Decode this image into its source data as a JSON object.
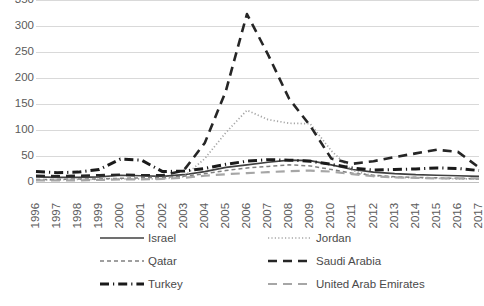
{
  "chart_data": {
    "type": "line",
    "title": "",
    "xlabel": "",
    "ylabel": "",
    "grid": true,
    "legend_position": "bottom",
    "ylim": [
      0,
      350
    ],
    "yticks": [
      0,
      50,
      100,
      150,
      200,
      250,
      300,
      350
    ],
    "categories": [
      "1996",
      "1997",
      "1998",
      "1999",
      "2000",
      "2001",
      "2002",
      "2003",
      "2004",
      "2005",
      "2006",
      "2007",
      "2008",
      "2009",
      "2010",
      "2011",
      "2012",
      "2013",
      "2014",
      "2015",
      "2016",
      "2017"
    ],
    "series": [
      {
        "name": "Israel",
        "style": "solid",
        "color": "#404040",
        "values": [
          10,
          9,
          9,
          10,
          13,
          12,
          11,
          14,
          20,
          28,
          33,
          38,
          42,
          41,
          33,
          24,
          19,
          16,
          14,
          13,
          12,
          11
        ]
      },
      {
        "name": "Jordan",
        "style": "dotted",
        "color": "#a6a6a6",
        "values": [
          4,
          4,
          5,
          5,
          6,
          6,
          6,
          10,
          45,
          95,
          138,
          120,
          113,
          112,
          60,
          22,
          12,
          9,
          8,
          7,
          6,
          6
        ]
      },
      {
        "name": "Qatar",
        "style": "dashed-small",
        "color": "#808080",
        "values": [
          5,
          5,
          6,
          6,
          7,
          8,
          9,
          11,
          16,
          22,
          27,
          30,
          33,
          31,
          24,
          17,
          13,
          10,
          9,
          8,
          7,
          6
        ]
      },
      {
        "name": "Saudi Arabia",
        "style": "dashed-long",
        "color": "#262626",
        "values": [
          12,
          11,
          12,
          13,
          14,
          13,
          13,
          22,
          75,
          175,
          323,
          245,
          160,
          108,
          45,
          35,
          40,
          48,
          55,
          62,
          58,
          28
        ]
      },
      {
        "name": "Turkey",
        "style": "dash-dot",
        "color": "#1a1a1a",
        "values": [
          20,
          18,
          19,
          24,
          44,
          42,
          20,
          21,
          26,
          34,
          40,
          43,
          42,
          40,
          34,
          27,
          23,
          24,
          25,
          27,
          26,
          22
        ]
      },
      {
        "name": "United Arab Emirates",
        "style": "dashed-gray",
        "color": "#a6a6a6",
        "values": [
          3,
          3,
          3,
          4,
          5,
          5,
          6,
          8,
          12,
          15,
          17,
          19,
          21,
          22,
          20,
          15,
          11,
          9,
          8,
          7,
          7,
          7
        ]
      }
    ]
  },
  "legend": {
    "items": [
      {
        "label": "Israel"
      },
      {
        "label": "Jordan"
      },
      {
        "label": "Qatar"
      },
      {
        "label": "Saudi Arabia"
      },
      {
        "label": "Turkey"
      },
      {
        "label": "United Arab Emirates"
      }
    ]
  }
}
